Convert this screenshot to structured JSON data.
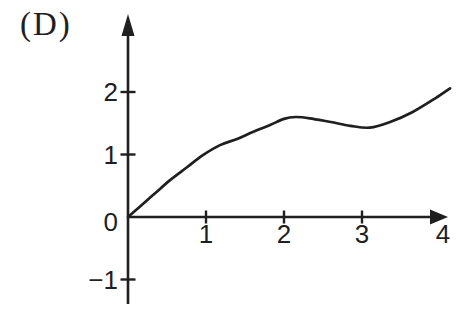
{
  "figure": {
    "label": "(D)"
  },
  "colors": {
    "ink": "#1f1f1f",
    "background": "#ffffff"
  },
  "chart_data": {
    "type": "line",
    "title": "",
    "xlabel": "",
    "ylabel": "",
    "xlim": [
      0,
      4.1
    ],
    "ylim": [
      -1.4,
      3.2
    ],
    "grid": false,
    "legend": false,
    "x_ticks": [
      {
        "value": 1,
        "label": "1",
        "mark": true
      },
      {
        "value": 2,
        "label": "2",
        "mark": true
      },
      {
        "value": 3,
        "label": "3",
        "mark": true
      },
      {
        "value": 4,
        "label": "4",
        "mark": false
      }
    ],
    "y_ticks": [
      {
        "value": 2,
        "label": "2",
        "mark": true
      },
      {
        "value": 1,
        "label": "1",
        "mark": true
      },
      {
        "value": 0,
        "label": "0",
        "mark": false
      },
      {
        "value": -1,
        "label": "−1",
        "mark": true
      }
    ],
    "series": [
      {
        "name": "curve",
        "points": [
          [
            0,
            0
          ],
          [
            0.32,
            0.35
          ],
          [
            0.54,
            0.59
          ],
          [
            0.76,
            0.8
          ],
          [
            0.96,
            0.99
          ],
          [
            1.18,
            1.15
          ],
          [
            1.4,
            1.25
          ],
          [
            1.6,
            1.36
          ],
          [
            1.82,
            1.47
          ],
          [
            2.0,
            1.57
          ],
          [
            2.15,
            1.6
          ],
          [
            2.33,
            1.58
          ],
          [
            2.6,
            1.52
          ],
          [
            2.85,
            1.46
          ],
          [
            3.1,
            1.43
          ],
          [
            3.36,
            1.52
          ],
          [
            3.65,
            1.68
          ],
          [
            3.94,
            1.9
          ],
          [
            4.13,
            2.06
          ]
        ]
      }
    ]
  }
}
